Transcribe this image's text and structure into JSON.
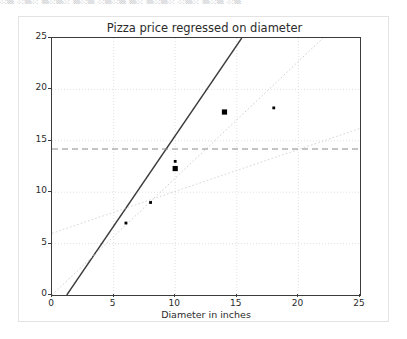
{
  "top_sliver": {
    "text": "░▒ ░▒░ ▒░▒░ ▒░▒ ░▒░▒   ▒░ ▒░▒░   ░▒░ ▒░▒ ░▒"
  },
  "chart_data": {
    "type": "scatter",
    "title": "Pizza price regressed on diameter",
    "xlabel": "Diameter in inches",
    "ylabel": "Price in dollars",
    "xlim": [
      0,
      25
    ],
    "ylim": [
      0,
      25
    ],
    "xticks": [
      0,
      5,
      10,
      15,
      20,
      25
    ],
    "yticks": [
      0,
      5,
      10,
      15,
      20,
      25
    ],
    "grid": true,
    "legend": "none",
    "series": [
      {
        "name": "observations",
        "type": "scatter",
        "color": "#000000",
        "points": [
          {
            "x": 6,
            "y": 7.0,
            "size": "small"
          },
          {
            "x": 8,
            "y": 9.0,
            "size": "small"
          },
          {
            "x": 10,
            "y": 13.0,
            "size": "small"
          },
          {
            "x": 10,
            "y": 12.3,
            "size": "large"
          },
          {
            "x": 14,
            "y": 17.8,
            "size": "large"
          },
          {
            "x": 18,
            "y": 18.2,
            "size": "small"
          }
        ]
      },
      {
        "name": "fitted regression line",
        "type": "line",
        "style": "solid",
        "color": "#3c3c3c",
        "x": [
          1.2,
          15.4
        ],
        "y": [
          0,
          25
        ]
      },
      {
        "name": "reference line steep",
        "type": "line",
        "style": "dotted",
        "color": "#cfcfcf",
        "x": [
          0,
          22.0
        ],
        "y": [
          0,
          25
        ]
      },
      {
        "name": "reference line shallow",
        "type": "line",
        "style": "dotted",
        "color": "#d6d6d6",
        "x": [
          0,
          25
        ],
        "y": [
          6.0,
          16.2
        ]
      },
      {
        "name": "mean price line",
        "type": "hline",
        "style": "dashed",
        "color": "#8a8a8a",
        "y": 14.2
      }
    ]
  }
}
